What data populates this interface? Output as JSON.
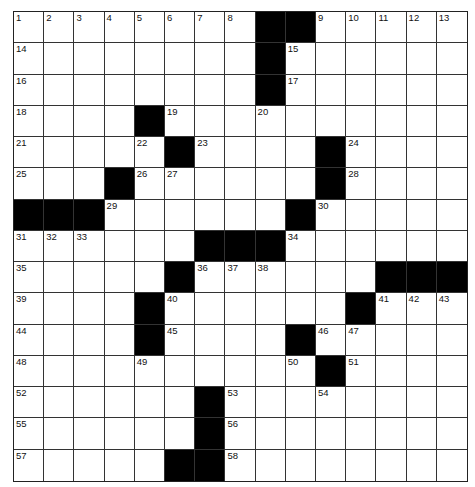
{
  "puzzle": {
    "rows": 15,
    "cols": 15,
    "colors": {
      "black_square": "#000000",
      "white_square": "#ffffff",
      "grid_line": "#333333"
    },
    "black_squares": [
      [
        0,
        8
      ],
      [
        0,
        9
      ],
      [
        1,
        8
      ],
      [
        2,
        8
      ],
      [
        3,
        4
      ],
      [
        4,
        5
      ],
      [
        4,
        10
      ],
      [
        5,
        3
      ],
      [
        5,
        10
      ],
      [
        6,
        0
      ],
      [
        6,
        1
      ],
      [
        6,
        2
      ],
      [
        6,
        9
      ],
      [
        7,
        6
      ],
      [
        7,
        7
      ],
      [
        7,
        8
      ],
      [
        8,
        5
      ],
      [
        8,
        12
      ],
      [
        8,
        13
      ],
      [
        8,
        14
      ],
      [
        9,
        4
      ],
      [
        9,
        11
      ],
      [
        10,
        4
      ],
      [
        10,
        9
      ],
      [
        11,
        10
      ],
      [
        12,
        6
      ],
      [
        13,
        6
      ],
      [
        14,
        5
      ],
      [
        14,
        6
      ]
    ],
    "numbers": [
      {
        "r": 0,
        "c": 0,
        "n": "1"
      },
      {
        "r": 0,
        "c": 1,
        "n": "2"
      },
      {
        "r": 0,
        "c": 2,
        "n": "3"
      },
      {
        "r": 0,
        "c": 3,
        "n": "4"
      },
      {
        "r": 0,
        "c": 4,
        "n": "5"
      },
      {
        "r": 0,
        "c": 5,
        "n": "6"
      },
      {
        "r": 0,
        "c": 6,
        "n": "7"
      },
      {
        "r": 0,
        "c": 7,
        "n": "8"
      },
      {
        "r": 0,
        "c": 10,
        "n": "9"
      },
      {
        "r": 0,
        "c": 11,
        "n": "10"
      },
      {
        "r": 0,
        "c": 12,
        "n": "11"
      },
      {
        "r": 0,
        "c": 13,
        "n": "12"
      },
      {
        "r": 0,
        "c": 14,
        "n": "13"
      },
      {
        "r": 1,
        "c": 0,
        "n": "14"
      },
      {
        "r": 1,
        "c": 9,
        "n": "15"
      },
      {
        "r": 2,
        "c": 0,
        "n": "16"
      },
      {
        "r": 2,
        "c": 9,
        "n": "17"
      },
      {
        "r": 3,
        "c": 0,
        "n": "18"
      },
      {
        "r": 3,
        "c": 5,
        "n": "19"
      },
      {
        "r": 3,
        "c": 8,
        "n": "20"
      },
      {
        "r": 4,
        "c": 0,
        "n": "21"
      },
      {
        "r": 4,
        "c": 4,
        "n": "22"
      },
      {
        "r": 4,
        "c": 6,
        "n": "23"
      },
      {
        "r": 4,
        "c": 11,
        "n": "24"
      },
      {
        "r": 5,
        "c": 0,
        "n": "25"
      },
      {
        "r": 5,
        "c": 4,
        "n": "26"
      },
      {
        "r": 5,
        "c": 5,
        "n": "27"
      },
      {
        "r": 5,
        "c": 11,
        "n": "28"
      },
      {
        "r": 6,
        "c": 3,
        "n": "29"
      },
      {
        "r": 6,
        "c": 10,
        "n": "30"
      },
      {
        "r": 7,
        "c": 0,
        "n": "31"
      },
      {
        "r": 7,
        "c": 1,
        "n": "32"
      },
      {
        "r": 7,
        "c": 2,
        "n": "33"
      },
      {
        "r": 7,
        "c": 9,
        "n": "34"
      },
      {
        "r": 8,
        "c": 0,
        "n": "35"
      },
      {
        "r": 8,
        "c": 6,
        "n": "36"
      },
      {
        "r": 8,
        "c": 7,
        "n": "37"
      },
      {
        "r": 8,
        "c": 8,
        "n": "38"
      },
      {
        "r": 9,
        "c": 0,
        "n": "39"
      },
      {
        "r": 9,
        "c": 5,
        "n": "40"
      },
      {
        "r": 9,
        "c": 12,
        "n": "41"
      },
      {
        "r": 9,
        "c": 13,
        "n": "42"
      },
      {
        "r": 9,
        "c": 14,
        "n": "43"
      },
      {
        "r": 10,
        "c": 0,
        "n": "44"
      },
      {
        "r": 10,
        "c": 5,
        "n": "45"
      },
      {
        "r": 10,
        "c": 10,
        "n": "46"
      },
      {
        "r": 10,
        "c": 11,
        "n": "47"
      },
      {
        "r": 11,
        "c": 0,
        "n": "48"
      },
      {
        "r": 11,
        "c": 4,
        "n": "49"
      },
      {
        "r": 11,
        "c": 9,
        "n": "50"
      },
      {
        "r": 11,
        "c": 11,
        "n": "51"
      },
      {
        "r": 12,
        "c": 0,
        "n": "52"
      },
      {
        "r": 12,
        "c": 7,
        "n": "53"
      },
      {
        "r": 12,
        "c": 10,
        "n": "54"
      },
      {
        "r": 13,
        "c": 0,
        "n": "55"
      },
      {
        "r": 13,
        "c": 7,
        "n": "56"
      },
      {
        "r": 14,
        "c": 0,
        "n": "57"
      },
      {
        "r": 14,
        "c": 7,
        "n": "58"
      }
    ]
  }
}
